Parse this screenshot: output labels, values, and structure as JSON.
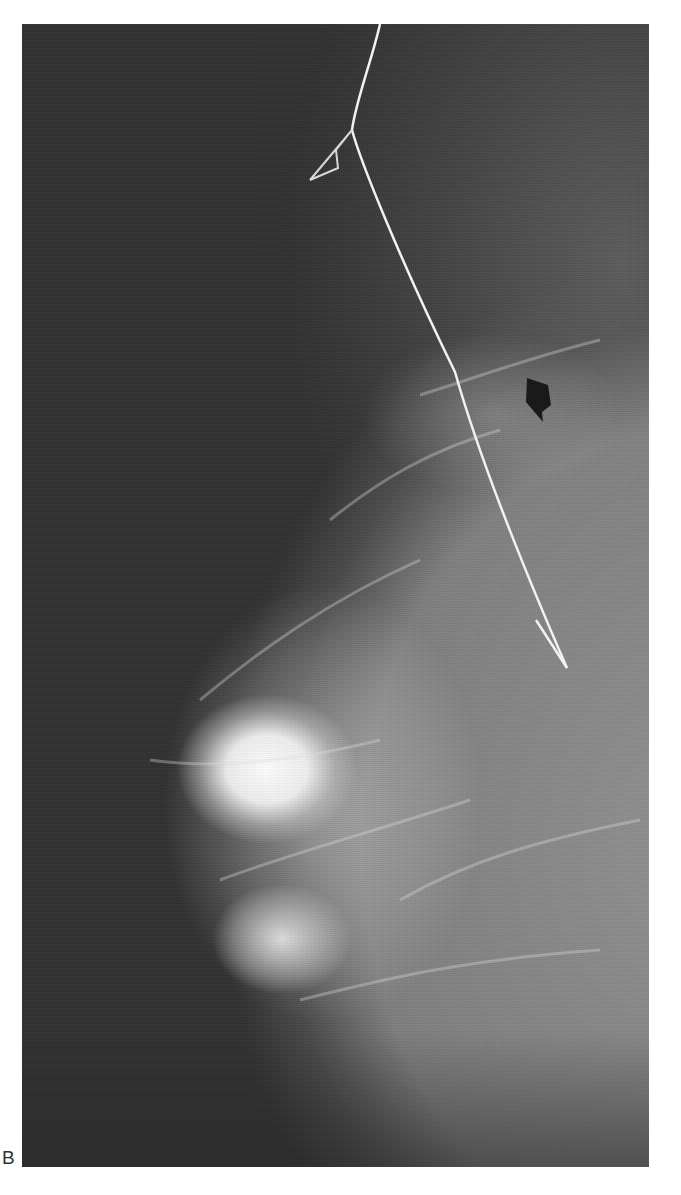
{
  "figure": {
    "panel_label": "B",
    "colors": {
      "background": "#2e2e2e",
      "wire": "#f2f2f2",
      "marker": "#1a1a1a",
      "page": "#ffffff"
    }
  }
}
